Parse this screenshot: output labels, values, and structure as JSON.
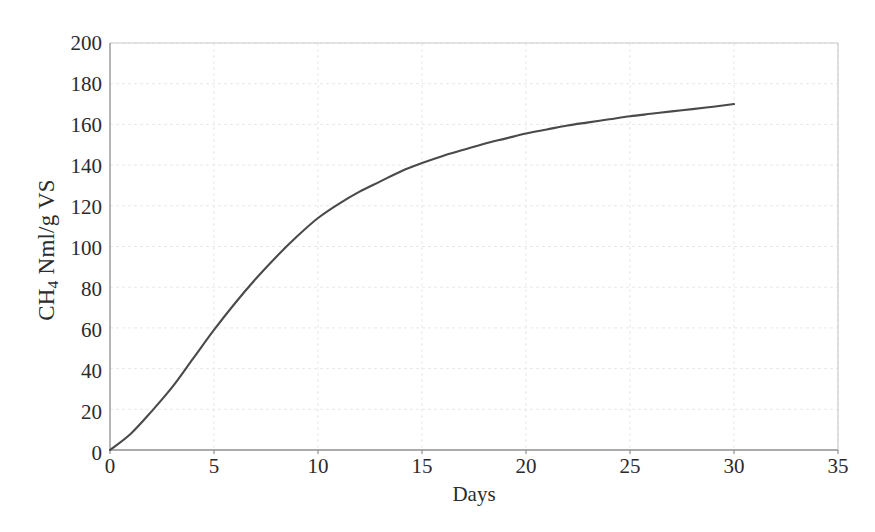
{
  "chart_data": {
    "type": "line",
    "title": "",
    "subtitle": "",
    "xlabel": "Days",
    "ylabel": "CH4 Nml/g VS",
    "ylabel_parts": {
      "prefix": "CH",
      "subscript": "4",
      "suffix": " Nml/g VS"
    },
    "xlim": [
      0,
      35
    ],
    "ylim": [
      0,
      200
    ],
    "xticks": [
      0,
      5,
      10,
      15,
      20,
      25,
      30,
      35
    ],
    "yticks": [
      0,
      20,
      40,
      60,
      80,
      100,
      120,
      140,
      160,
      180,
      200
    ],
    "grid": true,
    "grid_style": "dotted",
    "legend": false,
    "legend_position": "none",
    "series": [
      {
        "name": "Cumulative methane yield",
        "color": "#4a4a4a",
        "x": [
          0,
          1,
          2,
          3,
          4,
          5,
          6,
          7,
          8,
          9,
          10,
          11,
          12,
          13,
          14,
          15,
          16,
          17,
          18,
          19,
          20,
          21,
          22,
          23,
          24,
          25,
          26,
          27,
          28,
          29,
          30
        ],
        "y": [
          0,
          8,
          19,
          31,
          45,
          59,
          72,
          84,
          95,
          105,
          114,
          121,
          127,
          132,
          137,
          141,
          144.5,
          147.5,
          150.5,
          153,
          155.5,
          157.5,
          159.5,
          161,
          162.5,
          164,
          165.2,
          166.4,
          167.5,
          168.7,
          170
        ]
      }
    ],
    "annotations": []
  },
  "axis": {
    "x_tick_labels": [
      "0",
      "5",
      "10",
      "15",
      "20",
      "25",
      "30",
      "35"
    ],
    "y_tick_labels": [
      "0",
      "20",
      "40",
      "60",
      "80",
      "100",
      "120",
      "140",
      "160",
      "180",
      "200"
    ],
    "x_title": "Days",
    "y_title": "CH4 Nml/g VS"
  },
  "colors": {
    "curve": "#4a4a4a",
    "grid": "#e8e8e8",
    "frame": "#c9c9c9",
    "axis": "#8f8f8f",
    "text": "#2b2b2b",
    "background": "#ffffff"
  }
}
